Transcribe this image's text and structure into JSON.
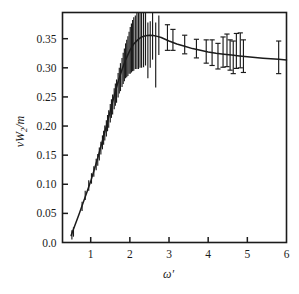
{
  "figure": {
    "name": "structure-function-plot",
    "background_color": "#ffffff",
    "ink_color": "#1b1b1b"
  },
  "chart_data": {
    "type": "scatter",
    "title": "",
    "xlabel": "ω′",
    "ylabel": "νW₂/m",
    "ylabel_parts": {
      "nu": "ν",
      "W": "W",
      "sub": "2",
      "slash_m": "/m"
    },
    "xlim": [
      0.28,
      6.0
    ],
    "ylim": [
      0.0,
      0.395
    ],
    "xticks": [
      1,
      2,
      3,
      4,
      5,
      6
    ],
    "xtick_labels": [
      "1",
      "2",
      "3",
      "4",
      "5",
      "6"
    ],
    "yticks": [
      0.0,
      0.05,
      0.1,
      0.15,
      0.2,
      0.25,
      0.3,
      0.35
    ],
    "ytick_labels": [
      "0.0",
      "0.05",
      "0.10",
      "0.15",
      "0.20",
      "0.25",
      "0.30",
      "0.35"
    ],
    "grid": false,
    "legend": null,
    "frame": "box",
    "tick_direction": "in",
    "series": [
      {
        "name": "fit-curve",
        "style": "line",
        "x": [
          0.5,
          0.6,
          0.7,
          0.8,
          0.9,
          1.0,
          1.1,
          1.2,
          1.3,
          1.4,
          1.5,
          1.6,
          1.7,
          1.8,
          1.9,
          2.0,
          2.1,
          2.2,
          2.3,
          2.4,
          2.5,
          2.6,
          2.7,
          2.8,
          2.9,
          3.0,
          3.2,
          3.4,
          3.6,
          3.8,
          4.0,
          4.2,
          4.4,
          4.6,
          4.8,
          5.0,
          5.2,
          5.4,
          5.6,
          5.8,
          6.0
        ],
        "y": [
          0.012,
          0.03,
          0.048,
          0.067,
          0.086,
          0.105,
          0.127,
          0.15,
          0.175,
          0.2,
          0.226,
          0.252,
          0.276,
          0.297,
          0.315,
          0.33,
          0.341,
          0.348,
          0.353,
          0.355,
          0.356,
          0.3555,
          0.354,
          0.352,
          0.349,
          0.346,
          0.341,
          0.337,
          0.333,
          0.33,
          0.327,
          0.325,
          0.3235,
          0.322,
          0.3205,
          0.319,
          0.3178,
          0.3166,
          0.3155,
          0.3145,
          0.3135
        ]
      },
      {
        "name": "data-points-errorbars",
        "style": "errorbar",
        "points": [
          {
            "x": 0.52,
            "y": 0.013,
            "err": 0.008
          },
          {
            "x": 0.56,
            "y": 0.018,
            "err": 0.008
          },
          {
            "x": 0.78,
            "y": 0.062,
            "err": 0.008
          },
          {
            "x": 0.86,
            "y": 0.081,
            "err": 0.008
          },
          {
            "x": 0.95,
            "y": 0.098,
            "err": 0.009
          },
          {
            "x": 1.02,
            "y": 0.11,
            "err": 0.009
          },
          {
            "x": 1.08,
            "y": 0.122,
            "err": 0.009
          },
          {
            "x": 1.14,
            "y": 0.134,
            "err": 0.01
          },
          {
            "x": 1.18,
            "y": 0.142,
            "err": 0.01
          },
          {
            "x": 1.22,
            "y": 0.152,
            "err": 0.011
          },
          {
            "x": 1.26,
            "y": 0.162,
            "err": 0.011
          },
          {
            "x": 1.3,
            "y": 0.172,
            "err": 0.012
          },
          {
            "x": 1.33,
            "y": 0.18,
            "err": 0.012
          },
          {
            "x": 1.36,
            "y": 0.188,
            "err": 0.013
          },
          {
            "x": 1.4,
            "y": 0.196,
            "err": 0.014
          },
          {
            "x": 1.43,
            "y": 0.205,
            "err": 0.014
          },
          {
            "x": 1.46,
            "y": 0.212,
            "err": 0.015
          },
          {
            "x": 1.5,
            "y": 0.222,
            "err": 0.016
          },
          {
            "x": 1.53,
            "y": 0.23,
            "err": 0.016
          },
          {
            "x": 1.56,
            "y": 0.237,
            "err": 0.017
          },
          {
            "x": 1.6,
            "y": 0.247,
            "err": 0.018
          },
          {
            "x": 1.63,
            "y": 0.254,
            "err": 0.019
          },
          {
            "x": 1.66,
            "y": 0.26,
            "err": 0.02
          },
          {
            "x": 1.7,
            "y": 0.27,
            "err": 0.021
          },
          {
            "x": 1.73,
            "y": 0.278,
            "err": 0.022
          },
          {
            "x": 1.76,
            "y": 0.284,
            "err": 0.024
          },
          {
            "x": 1.8,
            "y": 0.292,
            "err": 0.025
          },
          {
            "x": 1.83,
            "y": 0.299,
            "err": 0.027
          },
          {
            "x": 1.86,
            "y": 0.305,
            "err": 0.028
          },
          {
            "x": 1.89,
            "y": 0.312,
            "err": 0.03
          },
          {
            "x": 1.92,
            "y": 0.316,
            "err": 0.032
          },
          {
            "x": 1.95,
            "y": 0.32,
            "err": 0.034
          },
          {
            "x": 1.98,
            "y": 0.326,
            "err": 0.036
          },
          {
            "x": 2.01,
            "y": 0.33,
            "err": 0.04
          },
          {
            "x": 2.04,
            "y": 0.334,
            "err": 0.042
          },
          {
            "x": 2.07,
            "y": 0.338,
            "err": 0.044
          },
          {
            "x": 2.1,
            "y": 0.341,
            "err": 0.046
          },
          {
            "x": 2.14,
            "y": 0.344,
            "err": 0.046
          },
          {
            "x": 2.18,
            "y": 0.346,
            "err": 0.048
          },
          {
            "x": 2.22,
            "y": 0.348,
            "err": 0.05
          },
          {
            "x": 2.26,
            "y": 0.35,
            "err": 0.05
          },
          {
            "x": 2.3,
            "y": 0.352,
            "err": 0.052
          },
          {
            "x": 2.35,
            "y": 0.353,
            "err": 0.052
          },
          {
            "x": 2.4,
            "y": 0.354,
            "err": 0.05
          },
          {
            "x": 2.46,
            "y": 0.33,
            "err": 0.048
          },
          {
            "x": 2.52,
            "y": 0.34,
            "err": 0.04
          },
          {
            "x": 2.58,
            "y": 0.356,
            "err": 0.042
          },
          {
            "x": 2.66,
            "y": 0.322,
            "err": 0.056
          },
          {
            "x": 2.74,
            "y": 0.356,
            "err": 0.034
          },
          {
            "x": 2.96,
            "y": 0.352,
            "err": 0.022
          },
          {
            "x": 3.1,
            "y": 0.348,
            "err": 0.018
          },
          {
            "x": 3.4,
            "y": 0.34,
            "err": 0.016
          },
          {
            "x": 3.7,
            "y": 0.333,
            "err": 0.016
          },
          {
            "x": 3.95,
            "y": 0.328,
            "err": 0.02
          },
          {
            "x": 4.1,
            "y": 0.326,
            "err": 0.022
          },
          {
            "x": 4.25,
            "y": 0.32,
            "err": 0.022
          },
          {
            "x": 4.38,
            "y": 0.327,
            "err": 0.026
          },
          {
            "x": 4.48,
            "y": 0.33,
            "err": 0.028
          },
          {
            "x": 4.56,
            "y": 0.322,
            "err": 0.026
          },
          {
            "x": 4.64,
            "y": 0.318,
            "err": 0.028
          },
          {
            "x": 4.72,
            "y": 0.329,
            "err": 0.03
          },
          {
            "x": 4.82,
            "y": 0.33,
            "err": 0.03
          },
          {
            "x": 4.9,
            "y": 0.32,
            "err": 0.028
          },
          {
            "x": 5.8,
            "y": 0.318,
            "err": 0.028
          }
        ]
      }
    ]
  }
}
